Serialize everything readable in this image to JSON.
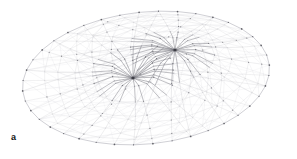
{
  "figure": {
    "panel_label": "a",
    "caption_visible": false,
    "background_color": "#ffffff",
    "line_color_light": "#c8c8cc",
    "line_color_mid": "#a5a5ad",
    "line_color_dark": "#6e6e78",
    "node_color": "#3a3a42"
  },
  "chart_data": {
    "type": "scatter",
    "title": "",
    "xlabel": "",
    "ylabel": "",
    "grid": false,
    "legend": "none",
    "xlim": [
      0,
      297
    ],
    "ylim": [
      0,
      159
    ],
    "geometry": {
      "plan_shape": "ellipse",
      "ellipse_center": [
        146,
        78
      ],
      "ellipse_rx": 124,
      "ellipse_ry": 66,
      "rotation_deg": -6,
      "rim_node_count": 40,
      "hub_count": 2,
      "ring_count": 5
    },
    "hubs": [
      {
        "name": "upper-right-hub",
        "x": 175,
        "y": 50,
        "spoke_count": 26,
        "influence_radius": 108
      },
      {
        "name": "lower-left-hub",
        "x": 133,
        "y": 78,
        "spoke_count": 26,
        "influence_radius": 96
      }
    ],
    "rings": [
      {
        "name": "ring-1",
        "t": 0.22
      },
      {
        "name": "ring-2",
        "t": 0.42
      },
      {
        "name": "ring-3",
        "t": 0.6
      },
      {
        "name": "ring-4",
        "t": 0.78
      },
      {
        "name": "ring-5",
        "t": 0.92
      }
    ]
  }
}
